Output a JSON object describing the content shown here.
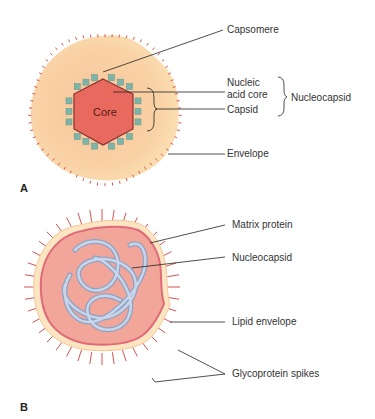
{
  "panel_a": {
    "letter": "A",
    "core_label": "Core",
    "labels": {
      "capsomere": "Capsomere",
      "nucleic_line1": "Nucleic",
      "nucleic_line2": "acid core",
      "capsid": "Capsid",
      "nucleocapsid": "Nucleocapsid",
      "envelope": "Envelope"
    }
  },
  "panel_b": {
    "letter": "B",
    "labels": {
      "matrix_protein": "Matrix protein",
      "nucleocapsid": "Nucleocapsid",
      "lipid_envelope": "Lipid envelope",
      "glycoprotein_spikes": "Glycoprotein spikes"
    }
  },
  "colors": {
    "envelope_fill": "#f9d3a8",
    "core_fill": "#e8695e",
    "capsomere_fill": "#7fb5a8",
    "spike": "#d9534f",
    "matrix": "#e67b80",
    "nucleocapsid_b": "#a9bedb",
    "leader_line": "#222222"
  }
}
